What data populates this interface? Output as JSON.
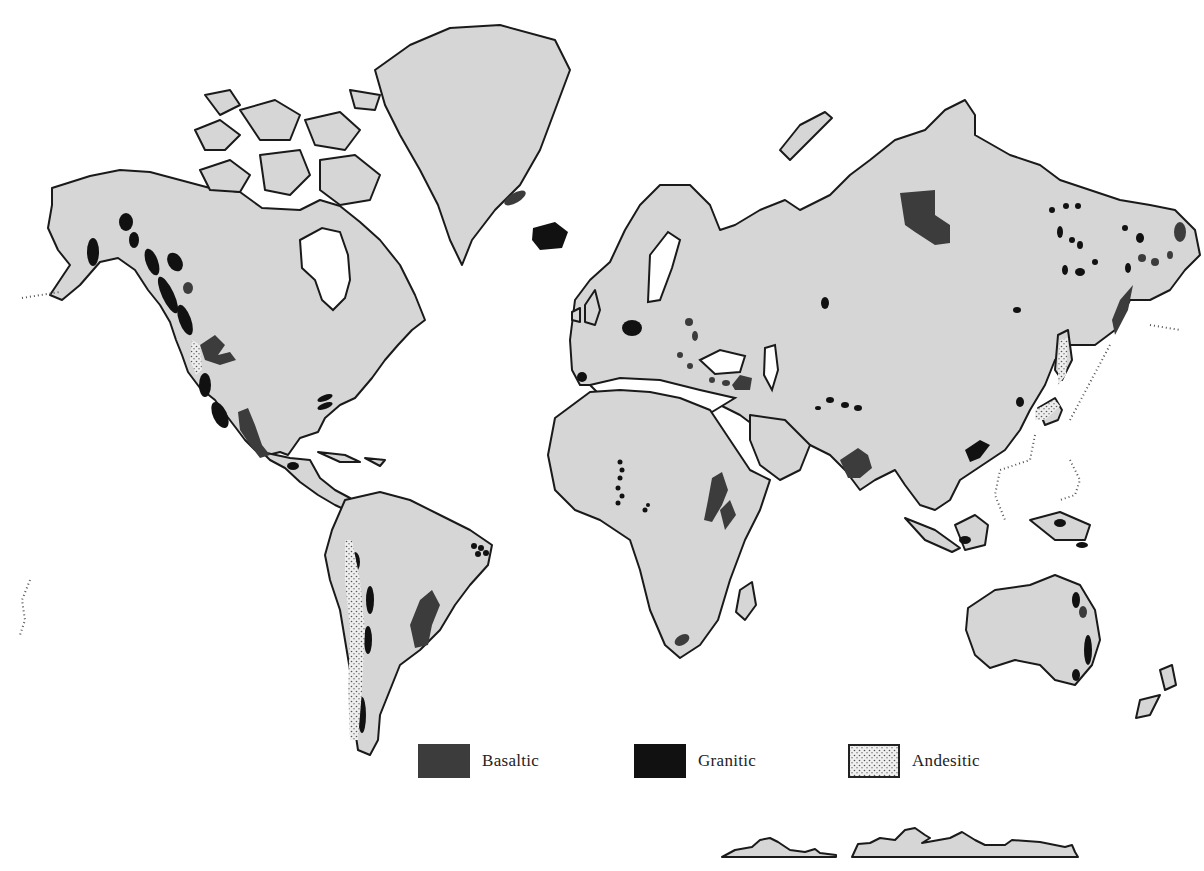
{
  "map": {
    "title": "World distribution of volcanic rock types",
    "background": "#ffffff",
    "land_color": "#d6d6d6",
    "coast_color": "#1a1a1a"
  },
  "legend": {
    "items": [
      {
        "label": "Basaltic",
        "color": "#3c3c3c",
        "pattern": "solid-dark-gray"
      },
      {
        "label": "Granitic",
        "color": "#111111",
        "pattern": "solid-black"
      },
      {
        "label": "Andesitic",
        "color": "#e8e8e8",
        "pattern": "stippled-dots"
      }
    ]
  }
}
